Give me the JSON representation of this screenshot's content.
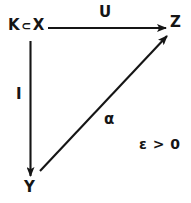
{
  "diagram": {
    "type": "commutative-diagram",
    "background_color": "#ffffff",
    "ink_color": "#151515",
    "nodes": [
      {
        "id": "kx",
        "label": "K ⊂ X",
        "symbol_left": "K",
        "relation": "⊂",
        "symbol_right": "X",
        "x": 8,
        "y": 18
      },
      {
        "id": "z",
        "label": "Z",
        "x": 170,
        "y": 15
      },
      {
        "id": "y",
        "label": "Y",
        "x": 24,
        "y": 180
      }
    ],
    "arrows": [
      {
        "id": "u",
        "label": "U",
        "from": "kx",
        "to": "z",
        "direction": "right",
        "label_x": 99,
        "label_y": 5
      },
      {
        "id": "i",
        "label": "I",
        "from": "kx",
        "to": "y",
        "direction": "down",
        "label_x": 16,
        "label_y": 87
      },
      {
        "id": "a",
        "label": "α",
        "from": "y",
        "to": "z",
        "direction": "up-right",
        "label_x": 104,
        "label_y": 112
      }
    ],
    "annotations": [
      {
        "id": "epsilon-condition",
        "text": "ε > 0",
        "x": 139,
        "y": 137
      }
    ]
  }
}
